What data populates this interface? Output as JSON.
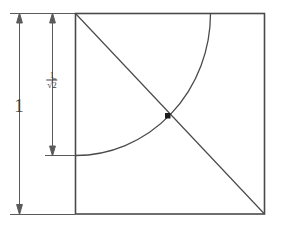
{
  "figure": {
    "background_color": "#ffffff",
    "line_color": "#4a4a4a",
    "text_color": "#3d3d3d",
    "width": 281,
    "height": 231
  },
  "labels": {
    "side_length": "1",
    "radius_numerator": "1",
    "radius_denominator_radical": "√",
    "radius_denominator_value": "2"
  },
  "geometry": {
    "square": {
      "left": 75,
      "top": 13,
      "right": 265,
      "bottom": 214,
      "side_label": "1"
    },
    "diagonal": {
      "from_x": 75,
      "from_y": 13,
      "to_x": 265,
      "to_y": 214
    },
    "arc": {
      "center_x": 75,
      "center_y": 13,
      "radius": 135,
      "start_x": 210,
      "start_y": 13,
      "end_x": 75,
      "end_y": 155,
      "label": "1/√2"
    },
    "intersection_point": {
      "x": 168,
      "y": 116
    },
    "dimension_full": {
      "x": 19,
      "top_y": 13,
      "bottom_y": 214,
      "label": "1"
    },
    "dimension_radius": {
      "x": 52,
      "top_y": 13,
      "bottom_y": 155,
      "label": "1/√2"
    }
  }
}
